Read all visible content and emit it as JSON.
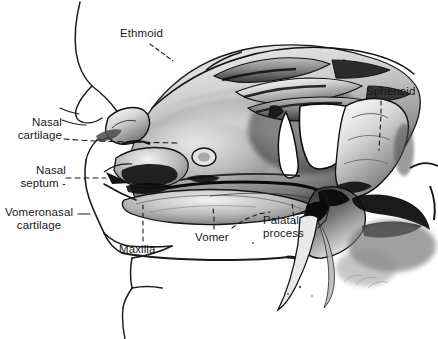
{
  "figure": {
    "background_color": "#ffffff",
    "ink_color": "#1a1a1a",
    "width": 438,
    "height": 339
  },
  "labels": [
    {
      "id": "ethmoid",
      "text": "Ethmoid",
      "x": 120,
      "y": 27,
      "align": "left"
    },
    {
      "id": "sphenoid",
      "text": "Sphenoid",
      "x": 366,
      "y": 85,
      "align": "left"
    },
    {
      "id": "nasal-cartilage",
      "text": "Nasal\ncartilage",
      "x": 8,
      "y": 116,
      "align": "right"
    },
    {
      "id": "nasal-septum",
      "text": "Nasal\nseptum -",
      "x": 8,
      "y": 165,
      "align": "right"
    },
    {
      "id": "vomeronasal-cartilage",
      "text": "Vomeronasal\ncartilage",
      "x": 2,
      "y": 206,
      "align": "center"
    },
    {
      "id": "maxilla",
      "text": "Maxilla",
      "x": 119,
      "y": 243,
      "align": "left"
    },
    {
      "id": "vomer",
      "text": "Vomer",
      "x": 195,
      "y": 231,
      "align": "left"
    },
    {
      "id": "palatal-process",
      "text": "Palatal\nprocess",
      "x": 263,
      "y": 214,
      "align": "left"
    }
  ],
  "leader_lines": [
    {
      "id": "ethmoid-leader",
      "style": "dashed",
      "points": "150,44 160,52 172,60"
    },
    {
      "id": "sphenoid-leader",
      "style": "dashed",
      "points": "380,100 380,112 379,128 378,146"
    },
    {
      "id": "nasal-cartilage-leader",
      "style": "dashed",
      "points": "64,140 100,142 140,143 178,143"
    },
    {
      "id": "nasal-septum-leader",
      "style": "dashed",
      "points": "66,178 84,178 104,178"
    },
    {
      "id": "vomeronasal-cartilage-leader",
      "style": "solid",
      "points": "78,215 88,215"
    },
    {
      "id": "maxilla-leader",
      "style": "dashed",
      "points": "143,240 143,228 143,215 143,205"
    },
    {
      "id": "vomer-leader",
      "style": "dashed",
      "points": "214,228 214,218 213,208"
    },
    {
      "id": "palatal-process-leader",
      "style": "solid",
      "points": "320,228 328,220 330,208 327,196 320,190"
    }
  ],
  "anatomy_parts": [
    "Ethmoid",
    "Sphenoid",
    "Nasal cartilage",
    "Nasal septum",
    "Vomeronasal cartilage",
    "Maxilla",
    "Vomer",
    "Palatal process"
  ]
}
